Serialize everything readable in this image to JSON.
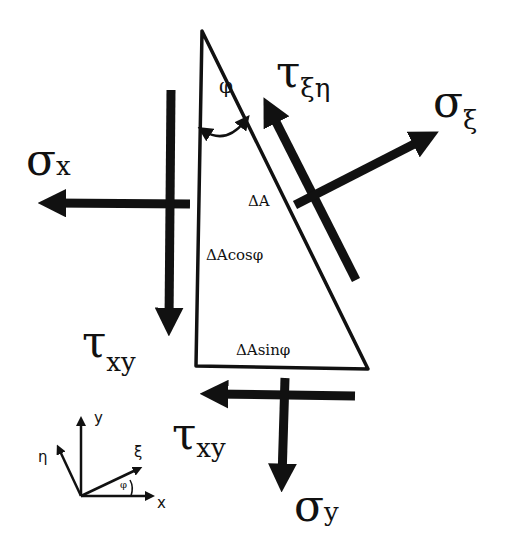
{
  "diagram": {
    "type": "stress element free-body diagram",
    "colors": {
      "ink": "#111111",
      "background": "#ffffff"
    },
    "triangle": {
      "angle_label": "φ",
      "hypotenuse_label": "ΔA",
      "vertical_side_label": "ΔAcosφ",
      "bottom_side_label": "ΔAsinφ"
    },
    "forces": {
      "sigma_x": {
        "symbol": "σ",
        "sub": "x"
      },
      "tau_xy_left": {
        "symbol": "τ",
        "sub": "xy"
      },
      "tau_xy_bottom": {
        "symbol": "τ",
        "sub": "xy"
      },
      "sigma_y": {
        "symbol": "σ",
        "sub": "y"
      },
      "tau_xi_eta": {
        "symbol": "τ",
        "sub": "ξη"
      },
      "sigma_xi": {
        "symbol": "σ",
        "sub": "ξ"
      }
    },
    "axes": {
      "x": "x",
      "y": "y",
      "xi": "ξ",
      "eta": "η",
      "angle": "φ"
    }
  }
}
